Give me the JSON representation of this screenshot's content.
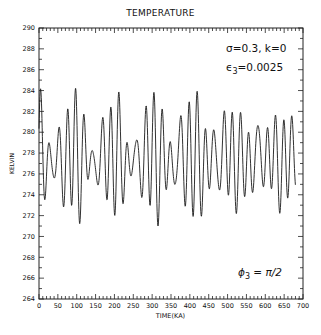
{
  "chart_data": {
    "type": "line",
    "title": "TEMPERATURE",
    "xlabel": "TIME(KA)",
    "ylabel": "KELVIN",
    "xlim": [
      0,
      700
    ],
    "ylim": [
      264,
      290
    ],
    "x_ticks": [
      0,
      50,
      100,
      150,
      200,
      250,
      300,
      350,
      400,
      450,
      500,
      550,
      600,
      650,
      700
    ],
    "x_tick_labels": [
      "0",
      "50",
      "100",
      "150",
      "200",
      "250",
      "300",
      "350",
      "400",
      "450",
      "500",
      "550",
      "600",
      "650",
      "700"
    ],
    "x_minor_step": 10,
    "y_ticks": [
      264,
      266,
      268,
      270,
      272,
      274,
      276,
      278,
      280,
      282,
      284,
      286,
      288,
      290
    ],
    "y_tick_labels": [
      "264",
      "266",
      "268",
      "270",
      "272",
      "274",
      "276",
      "278",
      "280",
      "282",
      "284",
      "286",
      "288",
      "290"
    ],
    "y_minor_step": 1,
    "grid": false,
    "series": [
      {
        "name": "temperature",
        "x_range": [
          0,
          680
        ],
        "mean": 277.5,
        "description": "Dense quasi-periodic oscillation (~23 ka dominant period) with amplitude modulation; peaks up to ~284 K, troughs down to ~269 K",
        "components": [
          {
            "period": 23.0,
            "amplitude": 3.6,
            "phase": 0.0
          },
          {
            "period": 19.0,
            "amplitude": 1.8,
            "phase": 1.1
          },
          {
            "period": 41.0,
            "amplitude": 0.9,
            "phase": 0.6
          },
          {
            "period": 100.0,
            "amplitude": 0.4,
            "phase": 2.0
          }
        ],
        "approx_extrema": {
          "max": 284.0,
          "min": 268.9
        }
      }
    ],
    "annotations": [
      {
        "text": "σ=0.3,  k=0",
        "x_frac": 0.71,
        "y_frac": 0.08
      },
      {
        "text": "ϵ₃=0.0025",
        "x_frac": 0.71,
        "y_frac": 0.17
      },
      {
        "text": "ϕ₃ = π/2",
        "x_frac": 0.77,
        "y_frac": 0.88
      }
    ]
  },
  "labels": {
    "title": "TEMPERATURE",
    "xlabel": "TIME(KA)",
    "ylabel": "KELVIN",
    "annot_params": "σ=0.3,  k=0",
    "annot_eps_symbol": "ϵ",
    "annot_eps_sub": "3",
    "annot_eps_value": "=0.0025",
    "annot_phi_symbol": "ϕ",
    "annot_phi_sub": "3",
    "annot_phi_value": " = π/2"
  },
  "colors": {
    "line": "#1a1a1a",
    "axis": "#222222",
    "background": "#ffffff"
  }
}
